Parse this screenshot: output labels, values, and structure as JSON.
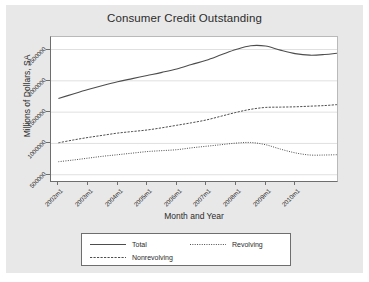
{
  "chart_data": {
    "type": "line",
    "title": "Consumer Credit Outstanding",
    "xlabel": "Month and Year",
    "ylabel": "Millions of Dollars, SA",
    "grid": true,
    "grid_axis": "y",
    "legend_position": "bottom",
    "xlim": [
      "2001m10",
      "2011m6"
    ],
    "ylim": [
      400000,
      2700000
    ],
    "ytick_labels": [
      "500000",
      "1000000",
      "1500000",
      "2000000",
      "2500000"
    ],
    "ytick_values": [
      500000,
      1000000,
      1500000,
      2000000,
      2500000
    ],
    "xtick_labels": [
      "2002m1",
      "2003m1",
      "2004m1",
      "2005m1",
      "2006m1",
      "2007m1",
      "2008m1",
      "2009m1",
      "2010m1"
    ],
    "x": [
      "2002m1",
      "2002m7",
      "2003m1",
      "2003m7",
      "2004m1",
      "2004m7",
      "2005m1",
      "2005m7",
      "2006m1",
      "2006m7",
      "2007m1",
      "2007m7",
      "2008m1",
      "2008m7",
      "2009m1",
      "2009m7",
      "2010m1",
      "2010m7",
      "2011m1",
      "2011m6"
    ],
    "series": [
      {
        "name": "Total",
        "style": "solid",
        "color": "#4d4d4d",
        "values": [
          1718000,
          1790000,
          1860000,
          1925000,
          1985000,
          2035000,
          2085000,
          2135000,
          2190000,
          2260000,
          2330000,
          2415000,
          2500000,
          2560000,
          2555000,
          2490000,
          2435000,
          2410000,
          2420000,
          2440000
        ]
      },
      {
        "name": "Nonrevolving",
        "style": "dashed",
        "color": "#4d4d4d",
        "values": [
          1010000,
          1055000,
          1095000,
          1130000,
          1165000,
          1190000,
          1215000,
          1250000,
          1290000,
          1330000,
          1375000,
          1435000,
          1495000,
          1545000,
          1575000,
          1580000,
          1585000,
          1595000,
          1605000,
          1620000
        ]
      },
      {
        "name": "Revolving",
        "style": "dotted",
        "color": "#4d4d4d",
        "values": [
          708000,
          735000,
          765000,
          795000,
          820000,
          845000,
          870000,
          885000,
          900000,
          930000,
          955000,
          980000,
          1005000,
          1015000,
          980000,
          910000,
          850000,
          815000,
          815000,
          820000
        ]
      }
    ]
  },
  "legend": {
    "entries": [
      {
        "label": "Total",
        "style": "solid"
      },
      {
        "label": "Revolving",
        "style": "dotted"
      },
      {
        "label": "Nonrevolving",
        "style": "dashed"
      }
    ]
  }
}
